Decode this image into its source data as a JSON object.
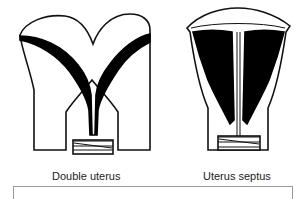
{
  "figures": [
    {
      "id": "double-uterus",
      "label": "Double uterus"
    },
    {
      "id": "uterus-septus",
      "label": "Uterus septus"
    }
  ],
  "colors": {
    "line": "#111111",
    "fill": "#000000",
    "background": "#ffffff",
    "box_border": "#999999"
  }
}
